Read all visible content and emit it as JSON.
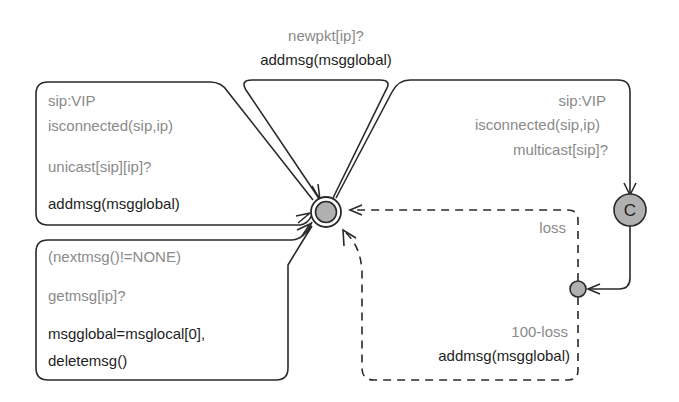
{
  "diagram": {
    "type": "timed-automaton",
    "locations": [
      {
        "id": "main",
        "kind": "initial",
        "fill": "#b0b0b0"
      },
      {
        "id": "committed",
        "kind": "committed",
        "label": "C",
        "fill": "#b0b0b0"
      },
      {
        "id": "branch",
        "kind": "branchpoint",
        "fill": "#b0b0b0"
      }
    ],
    "edges": {
      "top_loop": {
        "guard": "newpkt[ip]?",
        "update": "addmsg(msgglobal)"
      },
      "left_unicast": {
        "select": "sip:VIP",
        "guard": "isconnected(sip,ip)",
        "sync": "unicast[sip][ip]?",
        "update": "addmsg(msgglobal)"
      },
      "left_getmsg": {
        "guard": "(nextmsg()!=NONE)",
        "sync": "getmsg[ip]?",
        "update_line1": "msgglobal=msglocal[0],",
        "update_line2": "deletemsg()"
      },
      "right_multicast": {
        "select": "sip:VIP",
        "guard": "isconnected(sip,ip)",
        "sync": "multicast[sip]?"
      },
      "prob_loss": {
        "weight": "loss"
      },
      "prob_deliver": {
        "weight": "100-loss",
        "update": "addmsg(msgglobal)"
      }
    }
  }
}
